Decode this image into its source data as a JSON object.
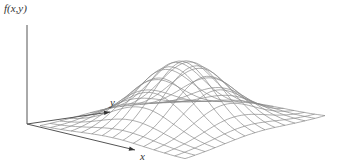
{
  "figure": {
    "labels": {
      "vertical_axis": "f(x,y)",
      "y_axis": "y",
      "x_axis": "x"
    },
    "colors": {
      "axis": "#555555",
      "mesh": "#8a8a8a",
      "text": "#333333",
      "background": "#ffffff"
    },
    "mesh": {
      "rows": 14,
      "cols": 14,
      "base_corners": {
        "left": [
          40,
          126
        ],
        "front": [
          185,
          159
        ],
        "right": [
          325,
          116
        ],
        "back": [
          180,
          100
        ]
      },
      "peak_height_px": 64,
      "sigma": 0.22
    },
    "axes": {
      "origin": [
        27,
        124
      ],
      "vertical_top": [
        27,
        25
      ],
      "y_axis_end": [
        110,
        112
      ],
      "x_axis_end": [
        135,
        150
      ]
    }
  }
}
